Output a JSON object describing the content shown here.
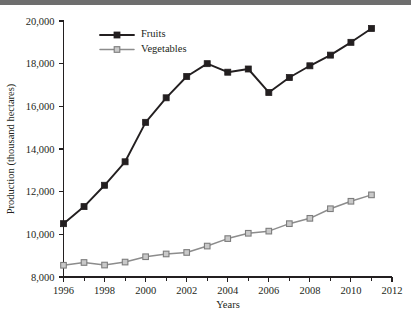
{
  "figure": {
    "background_color": "#ffffff",
    "top_band_color": "#6e6e6e"
  },
  "chart_data": {
    "type": "line",
    "title": "",
    "xlabel": "Years",
    "ylabel": "Production (thousand hectares)",
    "x": [
      1996,
      1997,
      1998,
      1999,
      2000,
      2001,
      2002,
      2003,
      2004,
      2005,
      2006,
      2007,
      2008,
      2009,
      2010,
      2011
    ],
    "xlim": [
      1996,
      2012
    ],
    "ylim": [
      8000,
      20000
    ],
    "xticks": [
      1996,
      1998,
      2000,
      2002,
      2004,
      2006,
      2008,
      2010,
      2012
    ],
    "xtick_labels": [
      "1996",
      "1998",
      "2000",
      "2002",
      "2004",
      "2006",
      "2008",
      "2010",
      "2012"
    ],
    "xticks_minor": [
      1997,
      1999,
      2001,
      2003,
      2005,
      2007,
      2009,
      2011
    ],
    "yticks": [
      8000,
      10000,
      12000,
      14000,
      16000,
      18000,
      20000
    ],
    "ytick_labels": [
      "8,000",
      "10,000",
      "12,000",
      "14,000",
      "16,000",
      "18,000",
      "20,000"
    ],
    "grid": false,
    "legend_position": "top-left-inside",
    "series": [
      {
        "name": "Fruits",
        "color": "#231f20",
        "marker": "filled-square",
        "values": [
          10500,
          11300,
          12300,
          13400,
          15250,
          16400,
          17400,
          18000,
          17600,
          17750,
          16650,
          17350,
          17900,
          18400,
          19000,
          19650
        ]
      },
      {
        "name": "Vegetables",
        "color": "#8c8c8c",
        "marker": "open-square",
        "values": [
          8550,
          8680,
          8560,
          8700,
          8950,
          9080,
          9150,
          9450,
          9800,
          10050,
          10150,
          10500,
          10750,
          11200,
          11550,
          11850
        ]
      }
    ]
  },
  "legend": {
    "entries": [
      {
        "label": "Fruits"
      },
      {
        "label": "Vegetables"
      }
    ]
  },
  "axes": {
    "x_title": "Years",
    "y_title": "Production (thousand hectares)"
  }
}
